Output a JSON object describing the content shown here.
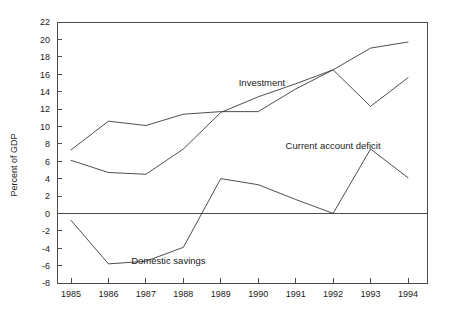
{
  "chart_data": {
    "type": "line",
    "title": "",
    "xlabel": "",
    "ylabel": "Percent of GDP",
    "x": [
      1985,
      1986,
      1987,
      1988,
      1989,
      1990,
      1991,
      1992,
      1993,
      1994
    ],
    "categories": [
      "1985",
      "1986",
      "1987",
      "1988",
      "1989",
      "1990",
      "1991",
      "1992",
      "1993",
      "1994"
    ],
    "xlim": [
      1985,
      1994
    ],
    "ylim": [
      -8,
      22
    ],
    "ytick_step": 2,
    "yticks": [
      -8,
      -6,
      -4,
      -2,
      0,
      2,
      4,
      6,
      8,
      10,
      12,
      14,
      16,
      18,
      20,
      22
    ],
    "ytick_labels": [
      "-8",
      "-6",
      "-4",
      "-2",
      "0",
      "2",
      "4",
      "6",
      "8",
      "10",
      "12",
      "14",
      "16",
      "18",
      "20",
      "22"
    ],
    "grid": false,
    "legend": "inline-annotations",
    "zero_line": true,
    "series": [
      {
        "name": "Investment",
        "values": [
          7.3,
          10.6,
          10.1,
          11.4,
          11.7,
          11.7,
          14.3,
          16.5,
          19.0,
          19.7
        ],
        "label_position": "inside-upper-middle"
      },
      {
        "name": "Domestic savings",
        "values": [
          6.1,
          4.7,
          4.5,
          7.4,
          11.6,
          13.4,
          14.9,
          16.5,
          12.3,
          15.6
        ],
        "label_position": "inside-lower-left"
      },
      {
        "name": "Current account deficit",
        "values": [
          -0.8,
          -5.8,
          -5.5,
          -3.9,
          4.0,
          3.3,
          1.6,
          0.0,
          7.4,
          4.1
        ],
        "label_position": "inside-right"
      }
    ],
    "annotations": [
      {
        "text": "Investment",
        "x": 1990.1,
        "y": 14.6
      },
      {
        "text": "Domestic savings",
        "x": 1987.6,
        "y": -5.8
      },
      {
        "text": "Current account deficit",
        "x": 1992.0,
        "y": 7.4
      }
    ],
    "colors": {
      "line": "#3a3a3a",
      "axis": "#4a4a4a",
      "text": "#1a1a1a",
      "background": "#ffffff"
    }
  }
}
